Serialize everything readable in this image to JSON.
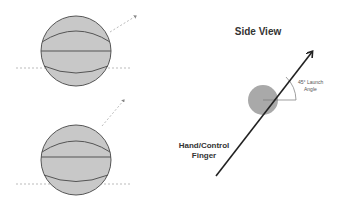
{
  "diagram": {
    "side_view_title": "Side View",
    "angle_label_line1": "45° Launch",
    "angle_label_line2": "Angle",
    "hand_label_line1": "Hand/Control",
    "hand_label_line2": "Finger"
  },
  "colors": {
    "ball_fill": "#c8c8c8",
    "ball_stroke": "#555555",
    "arrow": "#222222",
    "dashed": "#aaaaaa",
    "side_ball": "#a9a9a9"
  }
}
